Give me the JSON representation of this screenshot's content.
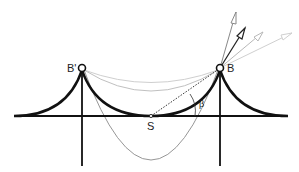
{
  "diagram": {
    "labels": {
      "left_anchor": "B'",
      "right_anchor": "B",
      "lowest_point": "S",
      "angle": "β"
    },
    "colors": {
      "main_stroke": "#111111",
      "parabola": "#888888",
      "light_curves": "#c8c8c8",
      "arrow_dark": "#222222",
      "arrow_mid": "#999999",
      "arrow_light": "#cccccc"
    }
  }
}
